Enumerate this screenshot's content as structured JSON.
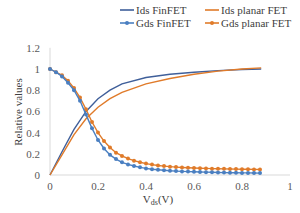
{
  "chart_data": {
    "type": "line",
    "title": "",
    "xlabel": "Vds(V)",
    "ylabel": "Relative values",
    "xlim": [
      0,
      1
    ],
    "ylim": [
      0,
      1.2
    ],
    "x_ticks": [
      "0",
      "0.2",
      "0.4",
      "0.6",
      "0.8",
      "1"
    ],
    "y_ticks": [
      "0",
      "0.2",
      "0.4",
      "0.6",
      "0.8",
      "1",
      "1.2"
    ],
    "grid": false,
    "legend_position": "top",
    "series": [
      {
        "name": "Ids FinFET",
        "color": "#3f5f9a",
        "marker": false,
        "x": [
          0,
          0.05,
          0.1,
          0.15,
          0.2,
          0.25,
          0.3,
          0.4,
          0.5,
          0.6,
          0.7,
          0.8,
          0.88
        ],
        "y": [
          0,
          0.22,
          0.43,
          0.6,
          0.72,
          0.8,
          0.86,
          0.92,
          0.95,
          0.97,
          0.985,
          0.995,
          1.0
        ]
      },
      {
        "name": "Ids planar FET",
        "color": "#e07b2a",
        "marker": false,
        "x": [
          0,
          0.05,
          0.1,
          0.15,
          0.2,
          0.25,
          0.3,
          0.4,
          0.5,
          0.6,
          0.7,
          0.8,
          0.88
        ],
        "y": [
          0,
          0.19,
          0.38,
          0.53,
          0.64,
          0.72,
          0.78,
          0.86,
          0.91,
          0.95,
          0.98,
          1.0,
          1.01
        ]
      },
      {
        "name": "Gds FinFET",
        "color": "#4a7fc1",
        "marker": true,
        "x": [
          0,
          0.025,
          0.05,
          0.075,
          0.1,
          0.125,
          0.15,
          0.175,
          0.2,
          0.225,
          0.25,
          0.275,
          0.3,
          0.325,
          0.35,
          0.375,
          0.4,
          0.425,
          0.45,
          0.475,
          0.5,
          0.525,
          0.55,
          0.575,
          0.6,
          0.625,
          0.65,
          0.675,
          0.7,
          0.725,
          0.75,
          0.775,
          0.8,
          0.825,
          0.85,
          0.875
        ],
        "y": [
          1.0,
          0.97,
          0.93,
          0.87,
          0.8,
          0.7,
          0.57,
          0.44,
          0.33,
          0.25,
          0.19,
          0.15,
          0.12,
          0.1,
          0.085,
          0.072,
          0.062,
          0.055,
          0.049,
          0.044,
          0.04,
          0.037,
          0.034,
          0.032,
          0.03,
          0.028,
          0.027,
          0.025,
          0.024,
          0.023,
          0.022,
          0.021,
          0.02,
          0.02,
          0.019,
          0.018
        ]
      },
      {
        "name": "Gds planar FET",
        "color": "#e07b2a",
        "marker": true,
        "x": [
          0,
          0.025,
          0.05,
          0.075,
          0.1,
          0.125,
          0.15,
          0.175,
          0.2,
          0.225,
          0.25,
          0.275,
          0.3,
          0.325,
          0.35,
          0.375,
          0.4,
          0.425,
          0.45,
          0.475,
          0.5,
          0.525,
          0.55,
          0.575,
          0.6,
          0.625,
          0.65,
          0.675,
          0.7,
          0.725,
          0.75,
          0.775,
          0.8,
          0.825,
          0.85,
          0.875
        ],
        "y": [
          1.0,
          0.97,
          0.94,
          0.89,
          0.82,
          0.73,
          0.62,
          0.5,
          0.4,
          0.32,
          0.26,
          0.21,
          0.18,
          0.155,
          0.135,
          0.12,
          0.108,
          0.098,
          0.09,
          0.084,
          0.079,
          0.075,
          0.071,
          0.068,
          0.066,
          0.064,
          0.062,
          0.06,
          0.059,
          0.058,
          0.057,
          0.056,
          0.055,
          0.054,
          0.053,
          0.052
        ]
      }
    ]
  }
}
